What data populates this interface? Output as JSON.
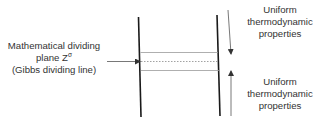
{
  "diagram": {
    "left_label": {
      "line1": "Mathematical dividing",
      "line2_prefix": "plane Z",
      "line2_superscript": "σ",
      "line3": "(Gibbs dividing line)"
    },
    "upper_region_label": {
      "line1": "Uniform",
      "line2": "thermodynamic",
      "line3": "properties"
    },
    "lower_region_label": {
      "line1": "Uniform",
      "line2": "thermodynamic",
      "line3": "properties"
    },
    "colors": {
      "boundary_line": "#1a1a1a",
      "interface_line": "#8a8a8a",
      "dividing_line": "#8a8a8a",
      "arrow": "#555555",
      "text": "#333333",
      "background": "#ffffff"
    }
  }
}
